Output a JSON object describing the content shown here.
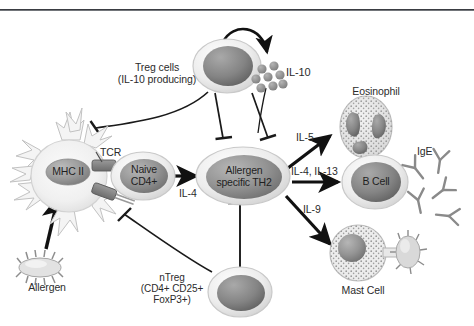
{
  "figure": {
    "title_rule": "",
    "background_color": "#ffffff",
    "ink_color": "#1f1f1f"
  },
  "cells": {
    "treg": {
      "label_line1": "Treg cells",
      "label_line2": "(IL-10 producing)",
      "name": "Treg cells (IL-10 producing)"
    },
    "dendritic": {
      "mhc_label": "MHC II",
      "tcr_label": "TCR"
    },
    "naive_t": {
      "label_line1": "Naive",
      "label_line2": "CD4+"
    },
    "th2": {
      "label_line1": "Allergen",
      "label_line2": "specific TH2"
    },
    "ntreg": {
      "label_line1": "nTreg",
      "label_line2": "(CD4+ CD25+",
      "label_line3": "FoxP3+)"
    },
    "eosinophil": {
      "label": "Eosinophil"
    },
    "bcell": {
      "label": "B Cell"
    },
    "mastcell": {
      "label": "Mast Cell"
    },
    "allergen": {
      "label": "Allergen"
    }
  },
  "molecules": {
    "il10": {
      "label": "IL-10",
      "particle_count": 8
    },
    "ige": {
      "label": "IgE",
      "antibody_count": 5
    }
  },
  "cytokine_arrows": [
    {
      "label": "IL-4",
      "from": "naive_t",
      "to": "th2"
    },
    {
      "label": "IL-5",
      "from": "th2",
      "to": "eosinophil"
    },
    {
      "label": "IL-4, IL-13",
      "from": "th2",
      "to": "bcell"
    },
    {
      "label": "IL-9",
      "from": "th2",
      "to": "mastcell"
    }
  ],
  "inhibitions": [
    {
      "from": "treg",
      "to": "dendritic"
    },
    {
      "from": "treg",
      "to": "naive_t"
    },
    {
      "from": "treg",
      "to": "th2"
    },
    {
      "from": "ntreg",
      "to": "th2"
    },
    {
      "from": "ntreg",
      "to": "dendritic"
    }
  ],
  "colors": {
    "cell_membrane": "#e9e9e9",
    "nucleus_dark": "#7c7c7c",
    "nucleus_mid": "#a0a0a0",
    "arrow": "#111111",
    "granule": "#8f8f8f"
  }
}
